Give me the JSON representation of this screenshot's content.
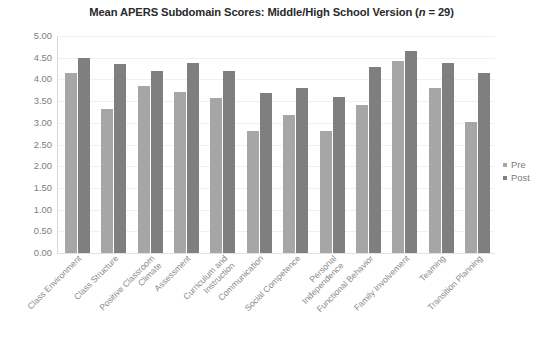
{
  "chart_data": {
    "type": "bar",
    "title": "Mean APERS Subdomain Scores: Middle/High School Version (n = 29)",
    "title_prefix": "Mean APERS Subdomain Scores: Middle/High School Version (",
    "title_italic": "n",
    "title_suffix": " = 29)",
    "xlabel": "",
    "ylabel": "",
    "ylim": [
      0,
      5
    ],
    "ytick_step": 0.5,
    "grid": true,
    "legend_position": "right",
    "categories": [
      "Class Environment",
      "Class Structure",
      "Positive Classroom Climate",
      "Assessment",
      "Curriculum and Instruction",
      "Communication",
      "Social Competence",
      "Personal Independence",
      "Functional Behavior",
      "Family Involvement",
      "Teaming",
      "Transition Planning"
    ],
    "category_lines": [
      [
        "Class Environment"
      ],
      [
        "Class Structure"
      ],
      [
        "Positive Classroom",
        "Climate"
      ],
      [
        "Assessment"
      ],
      [
        "Curriculum and",
        "Instruction"
      ],
      [
        "Communication"
      ],
      [
        "Social Competence"
      ],
      [
        "Personal",
        "Independence"
      ],
      [
        "Functional Behavior"
      ],
      [
        "Family Involvement"
      ],
      [
        "Teaming"
      ],
      [
        "Transition Planning"
      ]
    ],
    "series": [
      {
        "name": "Pre",
        "color": "#a6a6a6",
        "values": [
          4.15,
          3.32,
          3.85,
          3.72,
          3.57,
          2.8,
          3.17,
          2.82,
          3.4,
          4.42,
          3.8,
          3.03
        ]
      },
      {
        "name": "Post",
        "color": "#7f7f7f",
        "values": [
          4.5,
          4.35,
          4.2,
          4.38,
          4.2,
          3.68,
          3.8,
          3.6,
          4.28,
          4.65,
          4.37,
          4.15
        ]
      }
    ],
    "ytick_labels": [
      "5.00",
      "4.50",
      "4.00",
      "3.50",
      "3.00",
      "2.50",
      "2.00",
      "1.50",
      "1.00",
      "0.50",
      "0.00"
    ],
    "ytick_values": [
      5.0,
      4.5,
      4.0,
      3.5,
      3.0,
      2.5,
      2.0,
      1.5,
      1.0,
      0.5,
      0.0
    ]
  },
  "legend": {
    "items": [
      {
        "label": "Pre",
        "color": "#a6a6a6"
      },
      {
        "label": "Post",
        "color": "#7f7f7f"
      }
    ]
  }
}
